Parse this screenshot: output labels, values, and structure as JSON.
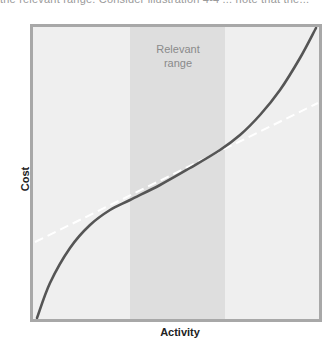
{
  "page": {
    "top_caption": "the relevant range. Consider illustration 4-4 ... note that the..."
  },
  "chart_data": {
    "type": "line",
    "title": "",
    "xlabel": "Activity",
    "ylabel": "Cost",
    "annotations": [
      {
        "text": "Relevant range",
        "lines": [
          "Relevant",
          "range"
        ],
        "type": "shaded-band",
        "x_start_px": 130,
        "x_end_px": 225
      }
    ],
    "grid": false,
    "legend": null,
    "axis_ticks": "none",
    "series": [
      {
        "name": "Actual cost curve",
        "style": "solid",
        "color": "#555555",
        "points_px": [
          [
            37,
            318
          ],
          [
            50,
            283
          ],
          [
            70,
            248
          ],
          [
            90,
            225
          ],
          [
            110,
            210
          ],
          [
            130,
            200
          ],
          [
            160,
            185
          ],
          [
            190,
            168
          ],
          [
            220,
            150
          ],
          [
            240,
            135
          ],
          [
            260,
            115
          ],
          [
            280,
            90
          ],
          [
            300,
            58
          ],
          [
            316,
            28
          ]
        ]
      },
      {
        "name": "Linear approximation",
        "style": "dashed",
        "color": "#ffffff",
        "points_px": [
          [
            35,
            242
          ],
          [
            318,
            103
          ]
        ]
      }
    ],
    "colors": {
      "background": "#ececec",
      "band": "#dedede",
      "frame": "#a8a8a8",
      "curve": "#555555",
      "dashed": "#ffffff"
    }
  },
  "labels": {
    "band_line1": "Relevant",
    "band_line2": "range",
    "x_axis": "Activity",
    "y_axis": "Cost"
  }
}
